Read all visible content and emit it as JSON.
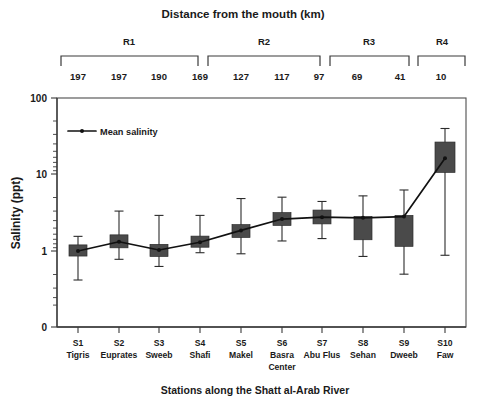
{
  "chart_data": {
    "type": "bar",
    "plot_kind": "box-plot-with-mean-line",
    "title": "Distance from the mouth (km)",
    "xlabel": "Stations along the Shatt al-Arab River",
    "ylabel": "Salinity (ppt)",
    "yscale": "log",
    "ylim": [
      0.3,
      100
    ],
    "ytick_labels": [
      "100",
      "10",
      "1",
      "0"
    ],
    "grid": false,
    "legend": {
      "position": "top-left",
      "entries": [
        "Mean salinity"
      ]
    },
    "colors": {
      "box_fill": "#4a4a4a",
      "box_stroke": "#2b2b2b",
      "line": "#111111",
      "axis": "#3a3a3a",
      "text": "#1a1a1a",
      "background": "#ffffff"
    },
    "categories": [
      "S1",
      "S2",
      "S3",
      "S4",
      "S5",
      "S6",
      "S7",
      "S8",
      "S9",
      "S10"
    ],
    "station_names": [
      "Tigris",
      "Euprates",
      "Sweeb",
      "Shafi",
      "Makel",
      "Basra Center",
      "Abu Flus",
      "Sehan",
      "Dweeb",
      "Faw"
    ],
    "distance_from_mouth_km": [
      197,
      197,
      190,
      169,
      127,
      117,
      97,
      69,
      41,
      10
    ],
    "regions": [
      {
        "label": "R1",
        "stations": [
          "S1",
          "S2",
          "S3",
          "S4"
        ]
      },
      {
        "label": "R2",
        "stations": [
          "S5",
          "S6",
          "S7"
        ]
      },
      {
        "label": "R3",
        "stations": [
          "S8",
          "S9"
        ]
      },
      {
        "label": "R4",
        "stations": [
          "S10"
        ]
      }
    ],
    "series": [
      {
        "name": "Mean salinity",
        "values": [
          1.0,
          1.32,
          1.03,
          1.3,
          1.85,
          2.6,
          2.75,
          2.7,
          2.8,
          16.0
        ]
      }
    ],
    "boxes": [
      {
        "category": "S1",
        "whisker_low": 0.42,
        "q1": 0.86,
        "median": 1.0,
        "q3": 1.2,
        "whisker_high": 1.55,
        "mean": 1.0
      },
      {
        "category": "S2",
        "whisker_low": 0.78,
        "q1": 1.1,
        "median": 1.32,
        "q3": 1.62,
        "whisker_high": 3.3,
        "mean": 1.32
      },
      {
        "category": "S3",
        "whisker_low": 0.63,
        "q1": 0.85,
        "median": 1.0,
        "q3": 1.22,
        "whisker_high": 2.9,
        "mean": 1.03
      },
      {
        "category": "S4",
        "whisker_low": 0.95,
        "q1": 1.12,
        "median": 1.3,
        "q3": 1.56,
        "whisker_high": 2.9,
        "mean": 1.3
      },
      {
        "category": "S5",
        "whisker_low": 0.92,
        "q1": 1.5,
        "median": 1.85,
        "q3": 2.2,
        "whisker_high": 4.8,
        "mean": 1.85
      },
      {
        "category": "S6",
        "whisker_low": 1.35,
        "q1": 2.15,
        "median": 2.6,
        "q3": 3.15,
        "whisker_high": 5.0,
        "mean": 2.6
      },
      {
        "category": "S7",
        "whisker_low": 1.45,
        "q1": 2.25,
        "median": 2.75,
        "q3": 3.4,
        "whisker_high": 4.4,
        "mean": 2.75
      },
      {
        "category": "S8",
        "whisker_low": 0.85,
        "q1": 1.4,
        "median": 2.0,
        "q3": 2.8,
        "whisker_high": 5.2,
        "mean": 2.7
      },
      {
        "category": "S9",
        "whisker_low": 0.5,
        "q1": 1.15,
        "median": 1.9,
        "q3": 2.9,
        "whisker_high": 6.2,
        "mean": 2.8
      },
      {
        "category": "S10",
        "whisker_low": 0.88,
        "q1": 10.5,
        "median": 16.0,
        "q3": 26.0,
        "whisker_high": 39.0,
        "mean": 16.0
      }
    ]
  }
}
